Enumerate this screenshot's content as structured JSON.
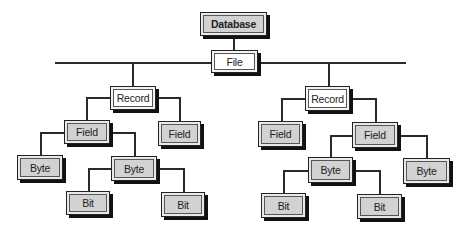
{
  "diagram": {
    "nodes": {
      "database": "Database",
      "file": "File",
      "record_left": "Record",
      "record_right": "Record",
      "field_l1": "Field",
      "field_l2": "Field",
      "field_r1": "Field",
      "field_r2": "Field",
      "byte_l1": "Byte",
      "byte_l2": "Byte",
      "byte_r1": "Byte",
      "byte_r2": "Byte",
      "bit_l1": "Bit",
      "bit_l2": "Bit",
      "bit_r1": "Bit",
      "bit_r2": "Bit"
    },
    "colors": {
      "line": "#2a2a2a",
      "gray_fill": "#d2d2d2",
      "white_fill": "#ffffff",
      "shadow": "#111111"
    }
  }
}
